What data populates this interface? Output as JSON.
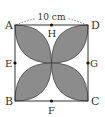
{
  "diagram": {
    "dimension_label": "10 cm",
    "vertices": {
      "A": "A",
      "B": "B",
      "C": "C",
      "D": "D"
    },
    "midpoints": {
      "E": "E",
      "F": "F",
      "G": "G",
      "H": "H"
    },
    "colors": {
      "petal_fill": "#8c8c8c",
      "stroke": "#333333",
      "background": "#ffffff"
    }
  }
}
